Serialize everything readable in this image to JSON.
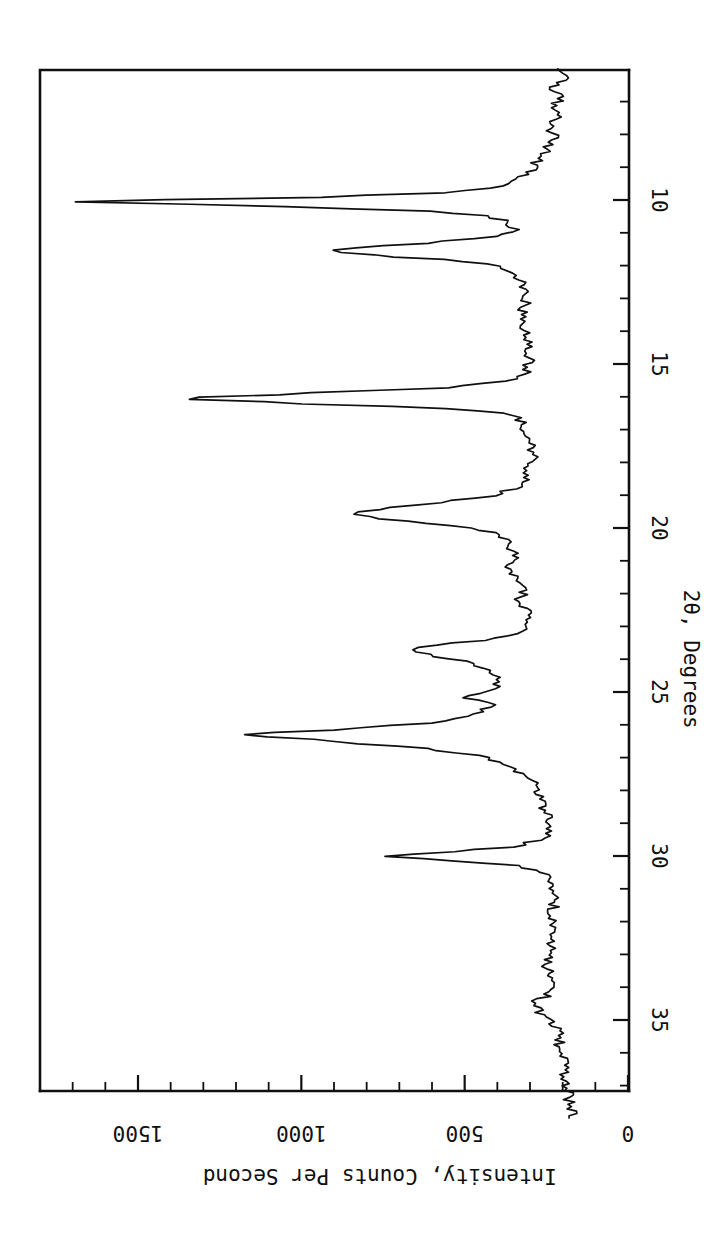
{
  "figure": {
    "orientation_note": "rotated-90",
    "background_color": "#ffffff",
    "line_color": "#101010"
  },
  "chart_data": {
    "type": "line",
    "title": "",
    "subtitle": "",
    "xlabel": "2θ, Degrees",
    "ylabel": "Intensity, Counts Per Second",
    "xlim": [
      6.0,
      38.0
    ],
    "ylim": [
      0,
      1750
    ],
    "grid": false,
    "legend": null,
    "x_ticks_major": [
      10,
      15,
      20,
      25,
      30,
      35
    ],
    "x_tick_labels": [
      "10",
      "15",
      "20",
      "25",
      "30",
      "35"
    ],
    "x_tick_minor_step": 1,
    "y_ticks_major": [
      0,
      500,
      1000,
      1500
    ],
    "y_tick_labels": [
      "0",
      "500",
      "1000",
      "1500"
    ],
    "y_tick_minor_step": 100,
    "peaks": [
      {
        "two_theta": 10.05,
        "intensity": 1700
      },
      {
        "two_theta": 11.55,
        "intensity": 920
      },
      {
        "two_theta": 16.05,
        "intensity": 1380
      },
      {
        "two_theta": 19.55,
        "intensity": 845
      },
      {
        "two_theta": 21.2,
        "intensity": 360
      },
      {
        "two_theta": 22.2,
        "intensity": 300
      },
      {
        "two_theta": 23.55,
        "intensity": 675
      },
      {
        "two_theta": 24.9,
        "intensity": 490
      },
      {
        "two_theta": 26.1,
        "intensity": 1185
      },
      {
        "two_theta": 30.0,
        "intensity": 730
      },
      {
        "two_theta": 33.3,
        "intensity": 250
      },
      {
        "two_theta": 34.5,
        "intensity": 290
      }
    ],
    "x": [
      6.0,
      6.3,
      6.6,
      6.9,
      7.2,
      7.5,
      7.8,
      8.1,
      8.4,
      8.7,
      9.0,
      9.2,
      9.4,
      9.6,
      9.75,
      9.9,
      10.05,
      10.2,
      10.35,
      10.5,
      10.7,
      10.9,
      11.1,
      11.3,
      11.45,
      11.55,
      11.7,
      11.85,
      12.0,
      12.2,
      12.5,
      12.8,
      13.1,
      13.4,
      13.7,
      14.0,
      14.3,
      14.6,
      14.9,
      15.2,
      15.45,
      15.7,
      15.9,
      16.05,
      16.2,
      16.35,
      16.5,
      16.7,
      16.95,
      17.2,
      17.5,
      17.8,
      18.1,
      18.4,
      18.7,
      19.0,
      19.2,
      19.4,
      19.55,
      19.7,
      19.85,
      20.0,
      20.2,
      20.45,
      20.7,
      20.95,
      21.2,
      21.45,
      21.7,
      21.95,
      22.2,
      22.45,
      22.7,
      22.95,
      23.2,
      23.4,
      23.55,
      23.7,
      23.9,
      24.1,
      24.35,
      24.6,
      24.9,
      25.15,
      25.4,
      25.65,
      25.9,
      26.1,
      26.3,
      26.5,
      26.75,
      27.0,
      27.3,
      27.6,
      27.9,
      28.2,
      28.5,
      28.8,
      29.1,
      29.4,
      29.7,
      29.85,
      30.0,
      30.15,
      30.3,
      30.5,
      30.75,
      31.0,
      31.3,
      31.6,
      31.9,
      32.2,
      32.5,
      32.8,
      33.0,
      33.3,
      33.6,
      33.9,
      34.2,
      34.5,
      34.8,
      35.1,
      35.4,
      35.7,
      36.0,
      36.3,
      36.6,
      36.9,
      37.2,
      37.5,
      37.8,
      38.0
    ],
    "y": [
      215,
      200,
      230,
      210,
      235,
      215,
      245,
      220,
      250,
      265,
      290,
      310,
      340,
      400,
      520,
      900,
      1700,
      1050,
      600,
      420,
      360,
      345,
      400,
      600,
      830,
      920,
      760,
      520,
      400,
      350,
      330,
      320,
      315,
      325,
      310,
      320,
      305,
      315,
      300,
      310,
      340,
      520,
      1000,
      1380,
      1020,
      560,
      380,
      330,
      315,
      300,
      295,
      290,
      300,
      310,
      330,
      400,
      560,
      740,
      845,
      770,
      620,
      480,
      400,
      370,
      355,
      345,
      360,
      345,
      325,
      320,
      330,
      315,
      305,
      310,
      330,
      420,
      580,
      675,
      600,
      480,
      420,
      400,
      395,
      490,
      420,
      460,
      560,
      820,
      1185,
      900,
      600,
      420,
      350,
      300,
      275,
      265,
      255,
      250,
      245,
      255,
      330,
      520,
      730,
      540,
      330,
      260,
      240,
      235,
      230,
      228,
      232,
      230,
      238,
      235,
      230,
      250,
      245,
      240,
      245,
      290,
      270,
      225,
      215,
      210,
      205,
      200,
      195,
      190,
      185,
      180,
      175,
      170,
      168
    ]
  },
  "axis_labels": {
    "x_title": "2θ, Degrees",
    "y_title": "Intensity, Counts Per Second",
    "x_ticks": [
      "10",
      "15",
      "20",
      "25",
      "30",
      "35"
    ],
    "y_ticks": [
      "1500",
      "1000",
      "500",
      "0"
    ]
  }
}
